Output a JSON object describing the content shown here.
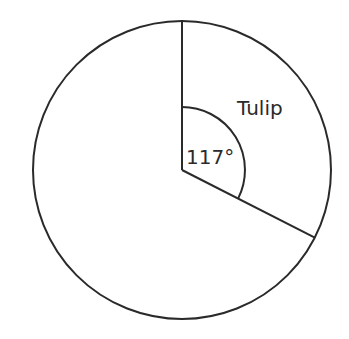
{
  "chart_data": {
    "type": "pie",
    "title": "",
    "slices": [
      {
        "label": "Tulip",
        "angle_deg": 117,
        "angle_label": "117°"
      },
      {
        "label": "",
        "angle_deg": 243
      }
    ],
    "annotations": [
      "Tulip",
      "117°"
    ],
    "start_angle": "top (12 o'clock), clockwise",
    "fill": "none (white)",
    "stroke": "#2a2a2a"
  },
  "labels": {
    "slice_name": "Tulip",
    "angle": "117°"
  },
  "geometry": {
    "cx": 182,
    "cy": 170,
    "r": 149,
    "arc_r": 63
  },
  "colors": {
    "stroke": "#2a2a2a",
    "background": "#ffffff"
  }
}
